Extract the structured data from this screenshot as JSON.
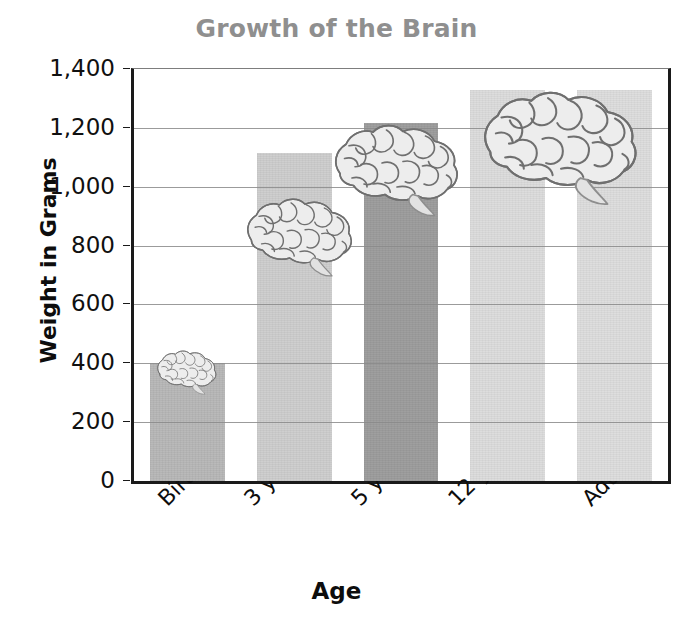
{
  "chart_data": {
    "type": "bar",
    "title": "Growth of the Brain",
    "xlabel": "Age",
    "ylabel": "Weight in Grams",
    "categories": [
      "Birth",
      "3 years",
      "5 years",
      "12 years",
      "Adult"
    ],
    "values": [
      400,
      1115,
      1215,
      1330,
      1330
    ],
    "ylim": [
      0,
      1400
    ],
    "ytick_values": [
      0,
      200,
      400,
      600,
      800,
      1000,
      1200,
      1400
    ],
    "ytick_labels": [
      "0",
      "200",
      "400",
      "600",
      "800",
      "1,000",
      "1,200",
      "1,400"
    ],
    "grid": true,
    "legend": "none",
    "bar_colors": [
      "#b7b7b7",
      "#cdcdcd",
      "#9c9c9c",
      "#dcdcdc",
      "#dddddd"
    ],
    "annotations": [
      "brain illustration on Birth bar",
      "brain illustration on 3 years bar",
      "brain illustration on 5 years bar",
      "large brain illustration spanning 12 years and Adult bars"
    ]
  },
  "style": {
    "title_color": "#8f8f8f",
    "axis_color": "#1a1a1a",
    "grid_color": "#8a8a8a",
    "text_color": "#0d0d0d",
    "background": "#ffffff"
  },
  "icons": {
    "brain": "brain-icon"
  }
}
